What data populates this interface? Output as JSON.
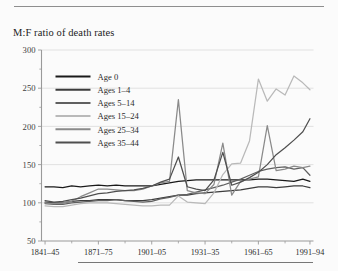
{
  "chart_data": {
    "type": "line",
    "title": "M:F ratio of death rates",
    "xlabel": "",
    "ylabel": "",
    "ylim": [
      50,
      300
    ],
    "yticks": [
      50,
      100,
      150,
      200,
      250,
      300
    ],
    "grid": true,
    "legend_position": "upper-left-inside",
    "xtick_labels": [
      "1841–45",
      "1871–75",
      "1901–05",
      "1931–35",
      "1961–65",
      "1991–94"
    ],
    "xtick_values": [
      1843,
      1873,
      1903,
      1933,
      1963,
      1992
    ],
    "x_minor_tick_values": [
      1858,
      1888,
      1918,
      1948,
      1978
    ],
    "x": [
      1843,
      1848,
      1853,
      1858,
      1863,
      1868,
      1873,
      1878,
      1883,
      1888,
      1893,
      1898,
      1903,
      1908,
      1913,
      1918,
      1923,
      1928,
      1933,
      1938,
      1943,
      1948,
      1953,
      1958,
      1963,
      1968,
      1973,
      1978,
      1983,
      1988,
      1992
    ],
    "series": [
      {
        "name": "Age 0",
        "color": "#1a1a1a",
        "values": [
          121,
          121,
          120,
          122,
          121,
          122,
          123,
          122,
          123,
          122,
          122,
          122,
          122,
          124,
          126,
          128,
          129,
          130,
          130,
          130,
          130,
          130,
          130,
          130,
          131,
          131,
          130,
          129,
          128,
          131,
          128
        ]
      },
      {
        "name": "Ages 1–4",
        "color": "#3c3c3c",
        "values": [
          101,
          100,
          100,
          102,
          103,
          103,
          104,
          104,
          104,
          103,
          103,
          103,
          104,
          106,
          108,
          110,
          110,
          112,
          113,
          114,
          115,
          116,
          117,
          119,
          121,
          121,
          120,
          121,
          122,
          122,
          120
        ]
      },
      {
        "name": "Ages 5–14",
        "color": "#606060",
        "values": [
          99,
          98,
          98,
          100,
          101,
          102,
          103,
          103,
          104,
          103,
          102,
          101,
          102,
          105,
          107,
          110,
          111,
          114,
          117,
          120,
          123,
          127,
          131,
          136,
          141,
          144,
          146,
          147,
          144,
          146,
          136
        ]
      },
      {
        "name": "Ages 15–24",
        "color": "#b9b9b9",
        "values": [
          96,
          95,
          95,
          97,
          99,
          100,
          100,
          100,
          99,
          98,
          97,
          96,
          96,
          97,
          97,
          109,
          101,
          100,
          99,
          113,
          137,
          151,
          152,
          181,
          262,
          233,
          249,
          241,
          266,
          257,
          248
        ]
      },
      {
        "name": "Ages 25–34",
        "color": "#8a8a8a",
        "values": [
          100,
          99,
          100,
          102,
          108,
          113,
          118,
          118,
          117,
          116,
          116,
          118,
          122,
          126,
          128,
          235,
          116,
          113,
          112,
          124,
          178,
          110,
          128,
          131,
          134,
          201,
          142,
          144,
          148,
          146,
          148
        ]
      },
      {
        "name": "Ages 35–44",
        "color": "#4f4f4f",
        "values": [
          103,
          101,
          102,
          104,
          106,
          109,
          112,
          113,
          115,
          116,
          117,
          119,
          122,
          127,
          131,
          160,
          121,
          118,
          116,
          130,
          166,
          123,
          127,
          133,
          140,
          150,
          163,
          172,
          182,
          193,
          210
        ]
      }
    ]
  },
  "legend": {
    "entries": [
      {
        "label": "Age 0",
        "color": "#1a1a1a"
      },
      {
        "label": "Ages 1–4",
        "color": "#3c3c3c"
      },
      {
        "label": "Ages 5–14",
        "color": "#606060"
      },
      {
        "label": "Ages 15–24",
        "color": "#b9b9b9"
      },
      {
        "label": "Ages 25–34",
        "color": "#8a8a8a"
      },
      {
        "label": "Ages 35–44",
        "color": "#4f4f4f"
      }
    ]
  }
}
